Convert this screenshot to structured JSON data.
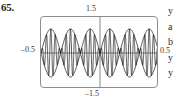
{
  "figure": {
    "exercise_number": "65.",
    "axis_labels": {
      "y_max": "1.5",
      "y_min": "–1.5",
      "x_min": "–0.5",
      "x_max": "0.5"
    }
  },
  "side_text": {
    "lines": [
      "y",
      "a",
      "b",
      "y",
      "y"
    ]
  },
  "colors": {
    "frame": "#8d8d90",
    "curve": "#1c1c1e",
    "axis": "#55555a",
    "label": "#3a3a3c",
    "background": "#ffffff"
  },
  "chart_data": {
    "type": "line",
    "title": "",
    "xlabel": "",
    "ylabel": "",
    "xlim": [
      -0.5,
      0.5
    ],
    "ylim": [
      -1.5,
      1.5
    ],
    "grid": false,
    "legend": null,
    "axes_shown": [
      "x-axis at y=0",
      "y-axis at x=0"
    ],
    "tick_labels": {
      "x": [
        "–0.5",
        "0.5"
      ],
      "y": [
        "–1.5",
        "1.5"
      ]
    },
    "series": [
      {
        "name": "modulated-wave",
        "role": "data",
        "formula": "sin(6*pi*x) * sin(54*pi*x)",
        "envelope_frequency_cycles": 3,
        "carrier_frequency_cycles": 27,
        "amplitude": 1.0
      },
      {
        "name": "upper-envelope",
        "role": "envelope",
        "formula": "sin(6*pi*x)",
        "cycles": 3,
        "amplitude": 1.0
      },
      {
        "name": "lower-envelope",
        "role": "envelope",
        "formula": "-sin(6*pi*x)",
        "cycles": 3,
        "amplitude": 1.0
      }
    ],
    "envelope_peaks": [
      {
        "x": -0.4167,
        "y": 1.0
      },
      {
        "x": -0.0833,
        "y": 1.0
      },
      {
        "x": 0.25,
        "y": 1.0
      }
    ],
    "envelope_troughs": [
      {
        "x": -0.25,
        "y": -1.0
      },
      {
        "x": 0.0833,
        "y": -1.0
      },
      {
        "x": 0.4167,
        "y": -1.0
      }
    ],
    "envelope_zeros": [
      -0.5,
      -0.3333,
      -0.1667,
      0.0,
      0.1667,
      0.3333,
      0.5
    ]
  }
}
